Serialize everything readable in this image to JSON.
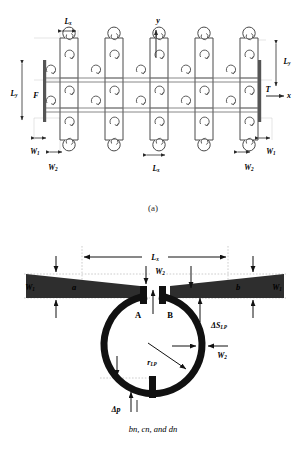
{
  "figure": {
    "captions": {
      "a": "(a)",
      "b": "(b)"
    },
    "colors": {
      "stroke": "#3a3a3a",
      "fill_light": "#ffffff",
      "dark": "#111111",
      "wedge": "#2e2e2e",
      "guide": "#999999",
      "text": "#1a1a1a"
    }
  },
  "panel_a": {
    "name": "periodic-lattice-unit-array",
    "axes": {
      "x_label": "x",
      "y_label": "y"
    },
    "boundary_labels": {
      "left": "F",
      "right": "T"
    },
    "dimensions": [
      {
        "id": "Lx-top",
        "base": "L",
        "sub": "x",
        "position": "top-left"
      },
      {
        "id": "Ly-left",
        "base": "L",
        "sub": "y",
        "position": "left"
      },
      {
        "id": "Ly-right",
        "base": "L",
        "sub": "y",
        "position": "right"
      },
      {
        "id": "W1-left",
        "base": "W",
        "sub": "1",
        "position": "bottom-left"
      },
      {
        "id": "W2-left",
        "base": "W",
        "sub": "2",
        "position": "bottom-left"
      },
      {
        "id": "Lx-bottom",
        "base": "L",
        "sub": "x",
        "position": "bottom-center"
      },
      {
        "id": "W1-right",
        "base": "W",
        "sub": "1",
        "position": "bottom-right"
      },
      {
        "id": "W2-right",
        "base": "W",
        "sub": "2",
        "position": "bottom-right"
      }
    ],
    "grid": {
      "columns": 5,
      "rows": 3
    }
  },
  "panel_b": {
    "name": "single-unit-cell-detail",
    "arm_labels": {
      "left": "a",
      "right": "b"
    },
    "gap_labels": {
      "left": "A",
      "right": "B"
    },
    "dimensions": [
      {
        "id": "Lx",
        "base": "L",
        "sub": "x",
        "position": "top"
      },
      {
        "id": "W1-l",
        "base": "W",
        "sub": "1",
        "position": "left"
      },
      {
        "id": "W1-r",
        "base": "W",
        "sub": "1",
        "position": "right"
      },
      {
        "id": "W2-top",
        "base": "W",
        "sub": "2",
        "position": "top-center"
      },
      {
        "id": "W2-side",
        "base": "W",
        "sub": "2",
        "position": "right"
      },
      {
        "id": "dS",
        "base": "ΔS",
        "sub": "LP",
        "position": "right"
      },
      {
        "id": "rLP",
        "base": "r",
        "sub": "LP",
        "position": "inside"
      },
      {
        "id": "dp",
        "base": "Δp",
        "sub": "",
        "position": "bottom"
      }
    ],
    "note": "bn, cn, and dn"
  }
}
